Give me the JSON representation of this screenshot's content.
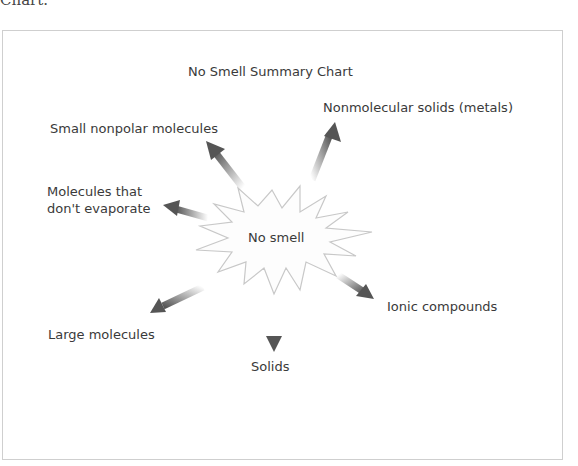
{
  "page": {
    "cutoff_text": "Chart."
  },
  "diagram": {
    "title": "No Smell Summary Chart",
    "center": "No smell",
    "branches": [
      {
        "label": "Nonmolecular solids (metals)",
        "direction": "up-right"
      },
      {
        "label": "Small nonpolar molecules",
        "direction": "up-left"
      },
      {
        "label": "Molecules that don't evaporate",
        "direction": "left"
      },
      {
        "label": "Large molecules",
        "direction": "down-left"
      },
      {
        "label": "Solids",
        "direction": "down"
      },
      {
        "label": "Ionic compounds",
        "direction": "down-right"
      }
    ],
    "colors": {
      "arrow": "#555555",
      "burst_stroke": "#c8c8c8",
      "frame": "#cfcfcf",
      "text": "#3a3a3a"
    }
  }
}
